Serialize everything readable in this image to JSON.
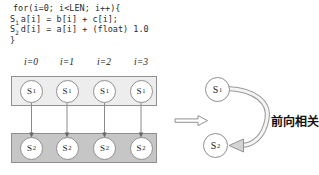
{
  "figure": {
    "code": {
      "line_for": "for(i=0; i<LEN; i++){",
      "stmt1": {
        "label": "S",
        "sub": "1",
        "text": "a[i] = b[i] + c[i];"
      },
      "stmt2": {
        "label": "S",
        "sub": "2",
        "text": "d[i] = a[i] + (float) 1.0"
      },
      "line_close": "}"
    },
    "iterations": [
      {
        "label": "i=0"
      },
      {
        "label": "i=1"
      },
      {
        "label": "i=2"
      },
      {
        "label": "i=3"
      }
    ],
    "s1_node": {
      "base": "S",
      "sub": "1"
    },
    "s2_node": {
      "base": "S",
      "sub": "2"
    },
    "annotation": "前向相关",
    "colors": {
      "top_box_fill": "#ededed",
      "bottom_box_fill": "#c6c6c6",
      "box_border": "#8f8f8f",
      "arrow_gray": "#8a8a8a",
      "text": "#2b2b2b"
    }
  }
}
